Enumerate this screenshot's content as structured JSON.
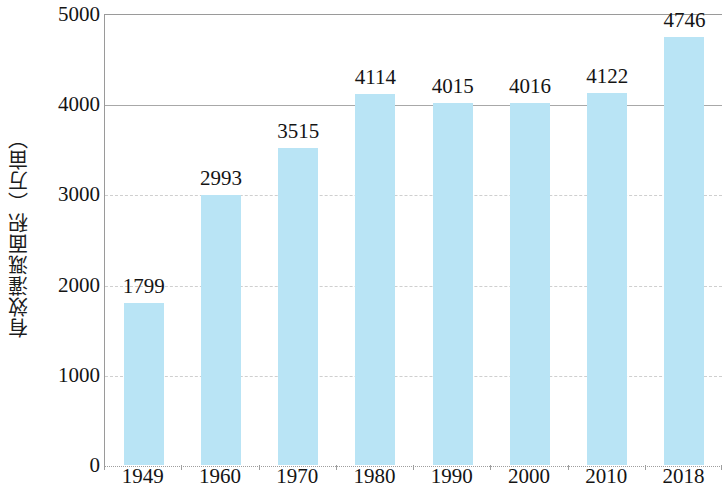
{
  "chart_data": {
    "type": "bar",
    "title": "",
    "subtitle": "",
    "xlabel": "",
    "ylabel": "有效灌溉面积（万亩）",
    "categories": [
      "1949",
      "1960",
      "1970",
      "1980",
      "1990",
      "2000",
      "2010",
      "2018"
    ],
    "values": [
      1799,
      2993,
      3515,
      4114,
      4015,
      4016,
      4122,
      4746
    ],
    "value_labels": [
      "1799",
      "2993",
      "3515",
      "4114",
      "4015",
      "4016",
      "4122",
      "4746"
    ],
    "series": [
      {
        "name": "有效灌溉面积",
        "values": [
          1799,
          2993,
          3515,
          4114,
          4015,
          4016,
          4122,
          4746
        ]
      }
    ],
    "ylim": [
      0,
      5000
    ],
    "yticks": [
      0,
      1000,
      2000,
      3000,
      4000,
      5000
    ],
    "ytick_labels": [
      "0",
      "1000",
      "2000",
      "3000",
      "4000",
      "5000"
    ],
    "grid": true,
    "grid_axis": "y",
    "legend": false,
    "legend_position": "none",
    "bar_color": "#b9e4f5",
    "axis_color": "#9a9a9a",
    "gridline_color": "#c6c6c6",
    "text_color": "#141414"
  }
}
